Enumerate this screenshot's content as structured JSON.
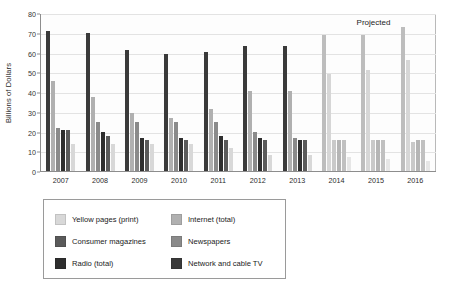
{
  "chart_data": {
    "type": "bar",
    "title": "",
    "xlabel": "",
    "ylabel": "Billions of Dollars",
    "ylim": [
      0,
      80
    ],
    "yticks": [
      0,
      10,
      20,
      30,
      40,
      50,
      60,
      70,
      80
    ],
    "grid": true,
    "legend_position": "below-left",
    "categories": [
      "2007",
      "2008",
      "2009",
      "2010",
      "2011",
      "2012",
      "2013",
      "2014",
      "2015",
      "2016"
    ],
    "annotations": [
      {
        "text": "Projected",
        "x": "2015",
        "note": "marks 2014-2016 as forecast values"
      }
    ],
    "series": [
      {
        "name": "Network and cable TV",
        "color": "#3a3a3a",
        "projected_color": "#bdbdbd",
        "values": [
          72,
          71,
          62,
          60,
          61,
          64,
          64,
          70,
          70,
          74
        ]
      },
      {
        "name": "Internet (total)",
        "color": "#b0b0b0",
        "projected_color": "#d6d6d6",
        "values": [
          46,
          38,
          30,
          27,
          32,
          41,
          41,
          50,
          52,
          57
        ]
      },
      {
        "name": "Newspapers",
        "color": "#8a8a8a",
        "projected_color": "#c9c9c9",
        "values": [
          22,
          25,
          25,
          25,
          25,
          20,
          17,
          16,
          16,
          15
        ]
      },
      {
        "name": "Radio (total)",
        "color": "#2e2e2e",
        "projected_color": "#b5b5b5",
        "values": [
          21,
          20,
          17,
          17,
          18,
          17,
          16,
          16,
          16,
          16
        ]
      },
      {
        "name": "Consumer magazines",
        "color": "#5a5a5a",
        "projected_color": "#c0c0c0",
        "values": [
          21,
          18,
          16,
          16,
          16,
          16,
          16,
          16,
          16,
          16
        ]
      },
      {
        "name": "Yellow pages (print)",
        "color": "#d8d8d8",
        "projected_color": "#e6e6e6",
        "values": [
          14,
          14,
          14,
          14,
          12,
          8,
          8,
          7,
          6,
          5
        ]
      }
    ]
  },
  "legend": {
    "items": [
      {
        "label": "Yellow pages (print)",
        "color": "#d8d8d8"
      },
      {
        "label": "Internet (total)",
        "color": "#b0b0b0"
      },
      {
        "label": "Consumer magazines",
        "color": "#5a5a5a"
      },
      {
        "label": "Newspapers",
        "color": "#8a8a8a"
      },
      {
        "label": "Radio (total)",
        "color": "#2e2e2e"
      },
      {
        "label": "Network and cable TV",
        "color": "#3a3a3a"
      }
    ]
  },
  "projected": {
    "label": "Projected",
    "start_category": "2014"
  }
}
